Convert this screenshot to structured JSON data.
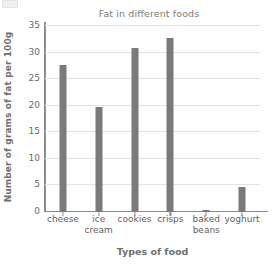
{
  "chart_data": {
    "type": "bar",
    "title": "Fat in different foods",
    "xlabel": "Types of food",
    "ylabel": "Number of grams of fat per 100g",
    "categories": [
      "cheese",
      "ice cream",
      "cookies",
      "crisps",
      "baked beans",
      "yoghurt"
    ],
    "category_lines": [
      [
        "cheese"
      ],
      [
        "ice",
        "cream"
      ],
      [
        "cookies"
      ],
      [
        "crisps"
      ],
      [
        "baked",
        "beans"
      ],
      [
        "yoghurt"
      ]
    ],
    "values": [
      27.7,
      19.8,
      30.8,
      32.8,
      0.4,
      4.7
    ],
    "ylim": [
      0,
      35
    ],
    "ytick_values": [
      0,
      5,
      10,
      15,
      20,
      25,
      30,
      35
    ],
    "ytick_labels": [
      "0",
      "5",
      "10",
      "15",
      "20",
      "25",
      "30",
      "35"
    ],
    "grid": true,
    "legend": false,
    "bar_color": "#7a7a7a",
    "grid_color": "#e3e3e3",
    "axis_color": "#8c8c8c",
    "text_color": "#6f6f6f"
  }
}
